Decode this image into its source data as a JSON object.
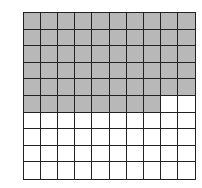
{
  "diagram": {
    "type": "hundred-grid",
    "rows": 10,
    "columns": 10,
    "total_cells": 100,
    "shaded_cells": 58,
    "shaded_fill_order": "row-major from top-left",
    "colors": {
      "shaded": "#b8b8b8",
      "unshaded": "#ffffff",
      "lines": "#222222"
    }
  }
}
